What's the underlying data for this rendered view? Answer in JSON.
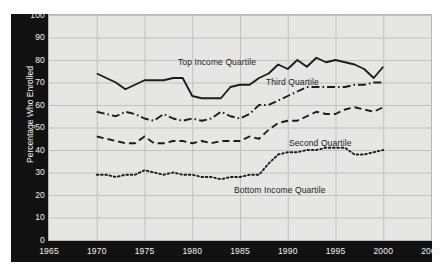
{
  "figure": {
    "background_color": "#ffffff",
    "plot_background_color": "#e6e6e4",
    "axis_band_color": "#111111",
    "axis_text_color": "#f2f2f0",
    "line_color": "#1c1c1c",
    "grid_color": "#b9b9b6"
  },
  "axes": {
    "ylabel": "Percentage Who Enrolled",
    "yticks": [
      "100",
      "90",
      "80",
      "70",
      "60",
      "50",
      "40",
      "30",
      "20",
      "10",
      "0"
    ],
    "xticks": [
      "1965",
      "1970",
      "1975",
      "1980",
      "1985",
      "1990",
      "1995",
      "2000",
      "2005"
    ]
  },
  "labels": {
    "top": "Top Income Quartile",
    "third": "Third Quartile",
    "second": "Second Quartile",
    "bottom": "Bottom Income Quartile"
  },
  "chart_data": {
    "type": "line",
    "title": "",
    "xlabel": "",
    "ylabel": "Percentage Who Enrolled",
    "xlim": [
      1965,
      2005
    ],
    "ylim": [
      0,
      100
    ],
    "xticks": [
      1965,
      1970,
      1975,
      1980,
      1985,
      1990,
      1995,
      2000,
      2005
    ],
    "yticks": [
      0,
      10,
      20,
      30,
      40,
      50,
      60,
      70,
      80,
      90,
      100
    ],
    "grid": true,
    "legend": "inline-annotations",
    "x": [
      1970,
      1971,
      1972,
      1973,
      1974,
      1975,
      1976,
      1977,
      1978,
      1979,
      1980,
      1981,
      1982,
      1983,
      1984,
      1985,
      1986,
      1987,
      1988,
      1989,
      1990,
      1991,
      1992,
      1993,
      1994,
      1995,
      1996,
      1997,
      1998,
      1999,
      2000
    ],
    "series": [
      {
        "name": "Top Income Quartile",
        "linestyle": "solid",
        "values": [
          74,
          72,
          70,
          67,
          69,
          71,
          71,
          71,
          72,
          72,
          64,
          63,
          63,
          63,
          68,
          69,
          69,
          72,
          74,
          78,
          76,
          80,
          77,
          81,
          79,
          80,
          79,
          78,
          76,
          72,
          77
        ]
      },
      {
        "name": "Third Quartile",
        "linestyle": "dashdot",
        "values": [
          57,
          56,
          55,
          57,
          56,
          54,
          53,
          56,
          54,
          53,
          54,
          53,
          54,
          57,
          55,
          54,
          56,
          60,
          60,
          62,
          64,
          66,
          68,
          68,
          68,
          68,
          68,
          69,
          69,
          70,
          70
        ]
      },
      {
        "name": "Second Quartile",
        "linestyle": "dashed",
        "values": [
          46,
          45,
          44,
          43,
          43,
          46,
          43,
          43,
          44,
          44,
          43,
          44,
          43,
          44,
          44,
          44,
          46,
          45,
          49,
          52,
          53,
          53,
          55,
          57,
          56,
          56,
          58,
          59,
          58,
          57,
          59
        ]
      },
      {
        "name": "Bottom Income Quartile",
        "linestyle": "dotted",
        "values": [
          29,
          29,
          28,
          29,
          29,
          31,
          30,
          29,
          30,
          29,
          29,
          28,
          28,
          27,
          28,
          28,
          29,
          29,
          34,
          38,
          39,
          39,
          40,
          40,
          41,
          41,
          41,
          38,
          38,
          39,
          40
        ]
      }
    ]
  }
}
